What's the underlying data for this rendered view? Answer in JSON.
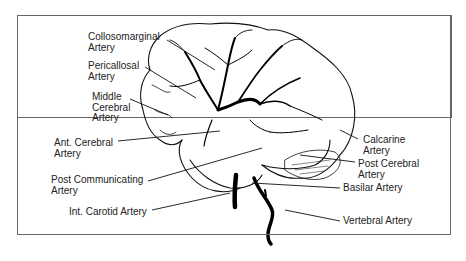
{
  "diagram": {
    "title": "",
    "labels": [
      {
        "id": "collosomarginal",
        "line1": "Collosomarginal",
        "line2": "Artery"
      },
      {
        "id": "pericallosal",
        "line1": "Pericallosal",
        "line2": "Artery"
      },
      {
        "id": "middle-cerebral",
        "line1": "Middle",
        "line2": "Cerebral",
        "line3": "Artery"
      },
      {
        "id": "ant-cerebral",
        "line1": "Ant. Cerebral",
        "line2": "Artery"
      },
      {
        "id": "post-communicating",
        "line1": "Post Communicating",
        "line2": "Artery"
      },
      {
        "id": "int-carotid",
        "line1": "Int. Carotid Artery"
      },
      {
        "id": "calcarine",
        "line1": "Calcarine",
        "line2": "Artery"
      },
      {
        "id": "post-cerebral",
        "line1": "Post Cerebral",
        "line2": "Artery"
      },
      {
        "id": "basilar",
        "line1": "Basilar Artery"
      },
      {
        "id": "vertebral",
        "line1": "Vertebral Artery"
      }
    ]
  }
}
